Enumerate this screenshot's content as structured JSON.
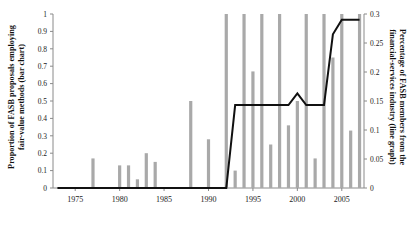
{
  "chart_data": {
    "type": "bar",
    "title": "",
    "subtitle": "",
    "xlabel": "",
    "ylabel": "Proportion of FASB proposals employing fair-value methods (bar chart)",
    "y2label": "Percentage of FASB members from the financial-services industry (line graph)",
    "grid": false,
    "legend": "none",
    "xlim": [
      1972.5,
      2007.5
    ],
    "ylim": [
      0,
      1
    ],
    "y2lim": [
      0,
      0.3
    ],
    "x_tick_labels": [
      "1975",
      "1980",
      "1985",
      "1990",
      "1995",
      "2000",
      "2005"
    ],
    "x_ticks": [
      1975,
      1980,
      1985,
      1990,
      1995,
      2000,
      2005
    ],
    "y_tick_labels": [
      "0",
      "0.1",
      "0.2",
      "0.3",
      "0.4",
      "0.5",
      "0.6",
      "0.7",
      "0.8",
      "0.9",
      "1"
    ],
    "y_ticks": [
      0,
      0.1,
      0.2,
      0.3,
      0.4,
      0.5,
      0.6,
      0.7,
      0.8,
      0.9,
      1
    ],
    "y2_tick_labels": [
      "0",
      "0.05",
      "0.1",
      "0.15",
      "0.2",
      "0.25",
      "0.3"
    ],
    "y2_ticks": [
      0,
      0.05,
      0.1,
      0.15,
      0.2,
      0.25,
      0.3
    ],
    "bar_color": "#a9a9a9",
    "line_color": "#111111",
    "axis_color": "#8a8a8a",
    "categories": [
      1973,
      1974,
      1975,
      1976,
      1977,
      1978,
      1979,
      1980,
      1981,
      1982,
      1983,
      1984,
      1985,
      1986,
      1987,
      1988,
      1989,
      1990,
      1991,
      1992,
      1993,
      1994,
      1995,
      1996,
      1997,
      1998,
      1999,
      2000,
      2001,
      2002,
      2003,
      2004,
      2005,
      2006,
      2007
    ],
    "series": [
      {
        "name": "Proportion of FASB proposals employing fair-value methods",
        "axis": "left",
        "type": "bar",
        "values": [
          0,
          0,
          0,
          0,
          0.17,
          0,
          0,
          0.13,
          0.13,
          0.05,
          0.2,
          0.15,
          0,
          0,
          0,
          0.5,
          0,
          0.28,
          0,
          1,
          0.1,
          1,
          0.67,
          1,
          0.25,
          1,
          0.36,
          0.5,
          1,
          0.17,
          1,
          0.75,
          1,
          0.33,
          1
        ]
      },
      {
        "name": "Percentage of FASB members from the financial-services industry",
        "axis": "right",
        "type": "line",
        "x": [
          1973,
          1992,
          1993,
          1994,
          1995,
          1996,
          1997,
          1998,
          1999,
          2000,
          2001,
          2002,
          2003,
          2004,
          2005,
          2007
        ],
        "values": [
          0,
          0,
          0.143,
          0.143,
          0.143,
          0.143,
          0.143,
          0.143,
          0.143,
          0.163,
          0.143,
          0.143,
          0.143,
          0.265,
          0.29,
          0.29
        ]
      }
    ]
  }
}
